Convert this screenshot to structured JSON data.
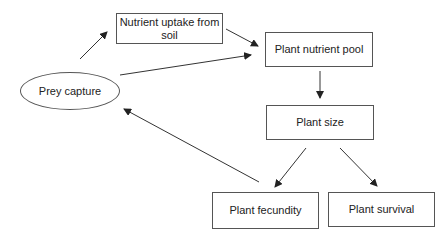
{
  "diagram": {
    "type": "flowchart",
    "nodes": {
      "prey_capture": "Prey capture",
      "nutrient_uptake": "Nutrient uptake from soil",
      "nutrient_pool": "Plant nutrient pool",
      "plant_size": "Plant size",
      "plant_fecundity": "Plant fecundity",
      "plant_survival": "Plant survival"
    },
    "edges": [
      {
        "from": "Prey capture",
        "to": "Nutrient uptake from soil"
      },
      {
        "from": "Nutrient uptake from soil",
        "to": "Plant nutrient pool"
      },
      {
        "from": "Prey capture",
        "to": "Plant nutrient pool"
      },
      {
        "from": "Plant nutrient pool",
        "to": "Plant size"
      },
      {
        "from": "Plant size",
        "to": "Plant fecundity"
      },
      {
        "from": "Plant size",
        "to": "Plant survival"
      },
      {
        "from": "Plant fecundity",
        "to": "Prey capture"
      }
    ]
  }
}
